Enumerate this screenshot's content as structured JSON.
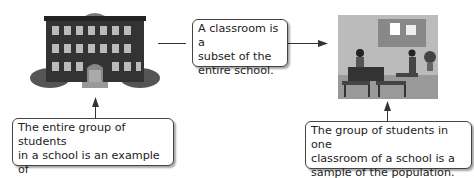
{
  "diagram": {
    "left_image": {
      "name": "school-building",
      "description": "Multi-story brick school building with bushes"
    },
    "right_image": {
      "name": "classroom",
      "description": "Classroom with teacher and students at desks"
    },
    "middle_box": {
      "text": "A classroom is a subset of the entire school.",
      "lines": [
        "A classroom is a",
        "subset of the",
        "entire school."
      ]
    },
    "left_box": {
      "lines": [
        "The entire group of students",
        "in a school is an example of",
        "a population."
      ]
    },
    "right_box": {
      "lines": [
        "The group of students in one",
        "classroom of a school is a",
        "sample of the population."
      ]
    }
  }
}
